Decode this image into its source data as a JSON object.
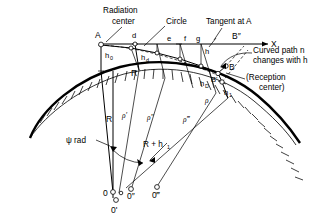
{
  "figure": {
    "annotations": {
      "radiation_center_line1": "Radiation",
      "radiation_center_line2": "center",
      "circle": "Circle",
      "tangent_at_a": "Tangent at A",
      "curved_path_line1": "Curved path n",
      "curved_path_line2": "changes with h",
      "reception_center_line1": "(Reception",
      "reception_center_line2": "center)"
    },
    "axis": {
      "x_label": "X"
    },
    "points": {
      "a": "A",
      "d": "d",
      "e": "e",
      "f": "f",
      "g": "g",
      "h": "h",
      "b": "B",
      "b_prime": "B'",
      "b_dprime": "B″"
    },
    "heights": {
      "h0_top": "h",
      "h0_top_sub": "0",
      "hd": "h",
      "hd_sub": "d",
      "hD_right": "h",
      "hD_right_sub": "D",
      "h1_right": "h",
      "h1_right_sub": "1"
    },
    "radii": {
      "r": "R",
      "r_psi": "R",
      "rho": "ρ",
      "rho_prime": "ρ′",
      "rho_dprime": "ρ″",
      "rho_tprime": "ρ‴",
      "r_plus_h1": "R + h",
      "r_plus_h1_sub": "1",
      "psi_rad": "ψ rad"
    },
    "origins": {
      "o": "0",
      "o_prime": "0'",
      "o_dprime": "0″",
      "o_tprime": "0‴"
    },
    "colors": {
      "ink": "#000000",
      "paper": "#ffffff"
    }
  }
}
